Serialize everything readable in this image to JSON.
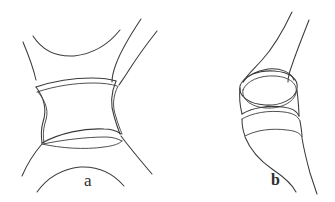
{
  "figure": {
    "background_color": "#ffffff",
    "ink_color": "#3b3b3b",
    "width": 335,
    "height": 202,
    "style": "pen-and-ink line drawing",
    "panels": [
      {
        "id": "a",
        "label": "a",
        "view": "frontal",
        "description": "Anteroposterior view of an intervertebral disc between two vertebral bodies",
        "label_position": {
          "x": 84,
          "y": 172
        }
      },
      {
        "id": "b",
        "label": "b",
        "view": "lateral",
        "description": "Lateral view of the same intervertebral joint",
        "label_position": {
          "x": 271,
          "y": 172
        }
      }
    ]
  }
}
